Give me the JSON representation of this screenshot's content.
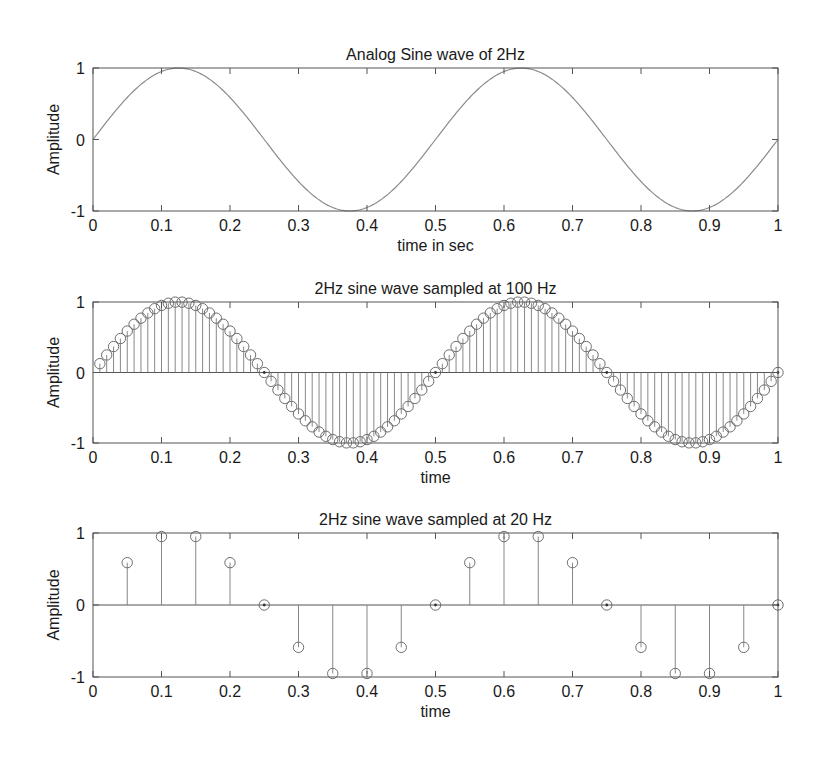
{
  "colors": {
    "axis": "#555555",
    "line": "#8a8a8a",
    "stem": "#7a7a7a",
    "marker": "#6e6e6e",
    "text": "#1a1a1a"
  },
  "chart_data": [
    {
      "type": "line",
      "title": "Analog Sine wave of 2Hz",
      "xlabel": "time in sec",
      "ylabel": "Amplitude",
      "xlim": [
        0,
        1
      ],
      "ylim": [
        -1,
        1
      ],
      "xticks": [
        "0",
        "0.1",
        "0.2",
        "0.3",
        "0.4",
        "0.5",
        "0.6",
        "0.7",
        "0.8",
        "0.9",
        "1"
      ],
      "yticks": [
        "-1",
        "0",
        "1"
      ],
      "function": "sin(2*pi*2*t)",
      "frequency_hz": 2,
      "grid": false,
      "box": {
        "left": 93,
        "right": 778,
        "top": 68,
        "bottom": 211
      }
    },
    {
      "type": "stem",
      "title": "2Hz sine wave sampled at 100 Hz",
      "xlabel": "time",
      "ylabel": "Amplitude",
      "xlim": [
        0,
        1
      ],
      "ylim": [
        -1,
        1
      ],
      "xticks": [
        "0",
        "0.1",
        "0.2",
        "0.3",
        "0.4",
        "0.5",
        "0.6",
        "0.7",
        "0.8",
        "0.9",
        "1"
      ],
      "yticks": [
        "-1",
        "0",
        "1"
      ],
      "frequency_hz": 2,
      "sample_rate_hz": 100,
      "samples": "t = 0.01..1.00 step 0.01, y = sin(2*pi*2*t)",
      "grid": false,
      "box": {
        "left": 93,
        "right": 778,
        "top": 302,
        "bottom": 443
      }
    },
    {
      "type": "stem",
      "title": "2Hz sine wave sampled at 20 Hz",
      "xlabel": "time",
      "ylabel": "Amplitude",
      "xlim": [
        0,
        1
      ],
      "ylim": [
        -1,
        1
      ],
      "xticks": [
        "0",
        "0.1",
        "0.2",
        "0.3",
        "0.4",
        "0.5",
        "0.6",
        "0.7",
        "0.8",
        "0.9",
        "1"
      ],
      "yticks": [
        "-1",
        "0",
        "1"
      ],
      "frequency_hz": 2,
      "sample_rate_hz": 20,
      "x": [
        0.05,
        0.1,
        0.15,
        0.2,
        0.25,
        0.3,
        0.35,
        0.4,
        0.45,
        0.5,
        0.55,
        0.6,
        0.65,
        0.7,
        0.75,
        0.8,
        0.85,
        0.9,
        0.95,
        1.0
      ],
      "values": [
        0.588,
        0.951,
        0.951,
        0.588,
        0,
        -0.588,
        -0.951,
        -0.951,
        -0.588,
        0,
        0.588,
        0.951,
        0.951,
        0.588,
        0,
        -0.588,
        -0.951,
        -0.951,
        -0.588,
        0
      ],
      "grid": false,
      "box": {
        "left": 93,
        "right": 778,
        "top": 533,
        "bottom": 677
      }
    }
  ]
}
